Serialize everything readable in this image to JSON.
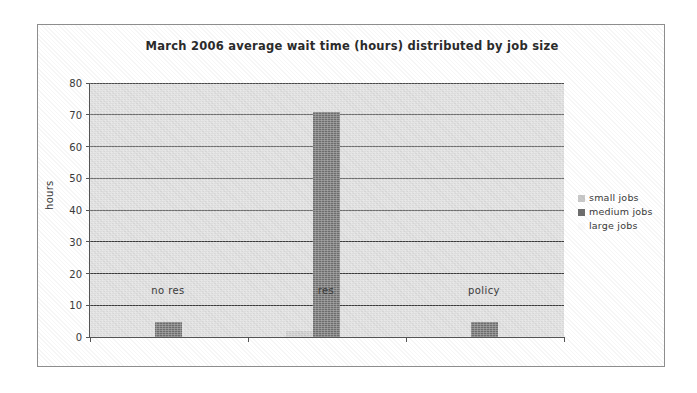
{
  "chart_data": {
    "type": "bar",
    "title": "March 2006 average wait time (hours) distributed by job size",
    "xlabel": "",
    "ylabel": "hours",
    "categories": [
      "no res",
      "res",
      "policy"
    ],
    "series": [
      {
        "name": "small jobs",
        "color": "#c9c9c9",
        "values": [
          0,
          2.0,
          0
        ]
      },
      {
        "name": "medium jobs",
        "color": "#6e6e6e",
        "values": [
          4.7,
          71,
          4.7
        ]
      },
      {
        "name": "large jobs",
        "color": "#fbfbfb",
        "values": [
          0,
          0,
          0
        ]
      }
    ],
    "ylim": [
      0,
      80
    ],
    "yticks": [
      0,
      10,
      20,
      30,
      40,
      50,
      60,
      70,
      80
    ],
    "ytick_labels": [
      "0",
      "10",
      "20",
      "30",
      "40",
      "50",
      "60",
      "70",
      "80"
    ],
    "grid": "horizontal",
    "legend_position": "right",
    "plot_background": "#dcdcdc",
    "gridline_color": "#3b3b3b",
    "axis_color": "#555555",
    "frame_color": "#8d8d8d",
    "title_color": "#2b2b2b"
  }
}
